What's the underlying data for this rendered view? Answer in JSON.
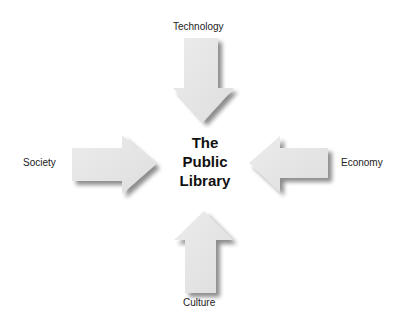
{
  "diagram": {
    "center": {
      "lines": [
        "The",
        "Public",
        "Library"
      ]
    },
    "forces": [
      {
        "label": "Technology",
        "direction": "down",
        "position": "top"
      },
      {
        "label": "Society",
        "direction": "right",
        "position": "left"
      },
      {
        "label": "Economy",
        "direction": "left",
        "position": "right"
      },
      {
        "label": "Culture",
        "direction": "up",
        "position": "bottom"
      }
    ],
    "colors": {
      "arrow_fill": "#e6e6e6",
      "arrow_shadow": "#9a9a9a",
      "text": "#222222"
    }
  }
}
